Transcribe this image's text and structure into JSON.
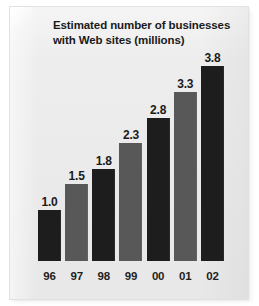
{
  "card": {
    "background_color": "#ededed"
  },
  "chart_data": {
    "type": "bar",
    "title": "Estimated number of businesses with Web sites (millions)",
    "xlabel": "",
    "ylabel": "",
    "ylim": [
      0,
      4.0
    ],
    "grid": false,
    "legend": "none",
    "categories": [
      "96",
      "97",
      "98",
      "99",
      "00",
      "01",
      "02"
    ],
    "values": [
      1.0,
      1.5,
      1.8,
      2.3,
      2.8,
      3.3,
      3.8
    ],
    "value_labels": [
      "1.0",
      "1.5",
      "1.8",
      "2.3",
      "2.8",
      "3.3",
      "3.8"
    ],
    "bar_colors": [
      "#1d1d1d",
      "#585858",
      "#1d1d1d",
      "#585858",
      "#1d1d1d",
      "#585858",
      "#1d1d1d"
    ],
    "series": [
      {
        "name": "Businesses with Web sites (millions)",
        "values": [
          1.0,
          1.5,
          1.8,
          2.3,
          2.8,
          3.3,
          3.8
        ]
      }
    ]
  }
}
